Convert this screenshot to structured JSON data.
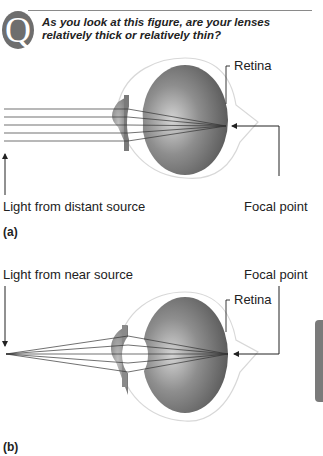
{
  "question": {
    "badge": "Q",
    "text": "As you look at this figure, are your lenses relatively thick or relatively thin?"
  },
  "panel_a": {
    "label": "(a)",
    "retina_label": "Retina",
    "source_label": "Light from distant source",
    "focal_label": "Focal point"
  },
  "panel_b": {
    "label": "(b)",
    "retina_label": "Retina",
    "source_label": "Light from near source",
    "focal_label": "Focal point"
  },
  "colors": {
    "eye_fill": "#6f6f6f",
    "eye_highlight": "#d6d6d6",
    "outline": "#d8d8d8",
    "line": "#222222"
  }
}
